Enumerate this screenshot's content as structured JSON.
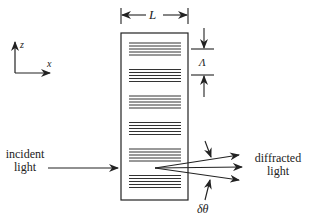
{
  "diagram": {
    "type": "volume-holographic-grating",
    "colors": {
      "ink": "#222222",
      "background": "#ffffff"
    },
    "axes": {
      "z_label": "z",
      "x_label": "x"
    },
    "dimensions": {
      "thickness_label": "L",
      "period_label": "Λ",
      "angle_label": "δθ"
    },
    "labels": {
      "incident_line1": "incident",
      "incident_line2": "light",
      "diffracted_line1": "diffracted",
      "diffracted_line2": "light"
    },
    "grating": {
      "groups": 6,
      "lines_per_group": 5
    },
    "diffracted_rays": 3
  }
}
